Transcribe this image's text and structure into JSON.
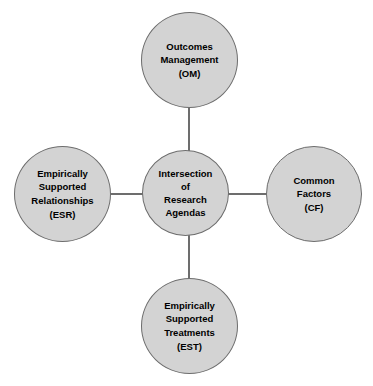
{
  "diagram": {
    "type": "hub-and-spoke",
    "style": {
      "node_fill": "#d3d3d3",
      "node_border": "#6d6d6d",
      "connector_color": "#6d6d6d",
      "text_color": "#000000",
      "background": "#ffffff"
    },
    "center": {
      "id": "intersection",
      "label": "Intersection\nof\nResearch\nAgendas",
      "lines": [
        "Intersection",
        "of",
        "Research",
        "Agendas"
      ]
    },
    "nodes": [
      {
        "id": "om",
        "position": "top",
        "label": "Outcomes\nManagement\n(OM)",
        "lines": [
          "Outcomes",
          "Management",
          "(OM)"
        ],
        "abbreviation": "OM",
        "name": "Outcomes Management"
      },
      {
        "id": "esr",
        "position": "left",
        "label": "Empirically\nSupported\nRelationships\n(ESR)",
        "lines": [
          "Empirically",
          "Supported",
          "Relationships",
          "(ESR)"
        ],
        "abbreviation": "ESR",
        "name": "Empirically Supported Relationships"
      },
      {
        "id": "cf",
        "position": "right",
        "label": "Common\nFactors\n(CF)",
        "lines": [
          "Common",
          "Factors",
          "(CF)"
        ],
        "abbreviation": "CF",
        "name": "Common Factors"
      },
      {
        "id": "est",
        "position": "bottom",
        "label": "Empirically\nSupported\nTreatments\n(EST)",
        "lines": [
          "Empirically",
          "Supported",
          "Treatments",
          "(EST)"
        ],
        "abbreviation": "EST",
        "name": "Empirically Supported Treatments"
      }
    ],
    "connectors": [
      {
        "id": "center-om",
        "from": "intersection",
        "to": "om",
        "orientation": "vertical"
      },
      {
        "id": "center-esr",
        "from": "intersection",
        "to": "esr",
        "orientation": "horizontal"
      },
      {
        "id": "center-cf",
        "from": "intersection",
        "to": "cf",
        "orientation": "horizontal"
      },
      {
        "id": "center-est",
        "from": "intersection",
        "to": "est",
        "orientation": "vertical"
      }
    ]
  }
}
